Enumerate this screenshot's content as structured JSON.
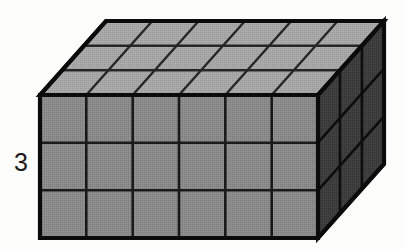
{
  "figure": {
    "kind": "3d-rectangular-prism-unit-cubes",
    "dimensions": {
      "width_units": 6,
      "height_units": 3,
      "depth_units": 3
    },
    "labels": {
      "height_label": "3"
    },
    "colors": {
      "front_face": "#8a8a8a",
      "top_face": "#a6a6a6",
      "right_face": "#3c3c3c",
      "outline": "#111111",
      "grid_line_front": "#1a1a1a",
      "grid_line_top": "#2a2a2a",
      "grid_line_right": "#111111",
      "background": "#fdfdfc",
      "label_text": "#1a1a1a"
    },
    "geometry": {
      "front_left_x": 40,
      "front_right_x": 318,
      "front_top_y": 95,
      "front_bottom_y": 238,
      "depth_dx": 66,
      "depth_dy": -74,
      "cols": 6,
      "rows": 3,
      "depth_steps": 3
    }
  }
}
